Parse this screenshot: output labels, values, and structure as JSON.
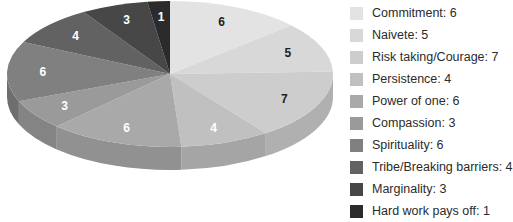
{
  "chart_data": {
    "type": "pie",
    "style": "3d",
    "title": "",
    "start_angle": "12 o'clock",
    "direction": "clockwise",
    "legend_position": "right",
    "categories": [
      "Commitment",
      "Naivete",
      "Risk taking/Courage",
      "Persistence",
      "Power of one",
      "Compassion",
      "Spirituality",
      "Tribe/Breaking barriers",
      "Marginality",
      "Hard work pays off"
    ],
    "values": [
      6,
      5,
      7,
      4,
      6,
      3,
      6,
      4,
      3,
      1
    ],
    "colors": [
      "#e3e3e3",
      "#d8d8d8",
      "#cdcdcd",
      "#c0c0c0",
      "#a9a9a9",
      "#9a9a9a",
      "#808080",
      "#626262",
      "#474747",
      "#2b2b2b"
    ],
    "label_colors": [
      "#1e1e1e",
      "#1e1e1e",
      "#1e1e1e",
      "#ffffff",
      "#ffffff",
      "#ffffff",
      "#ffffff",
      "#ffffff",
      "#ffffff",
      "#ffffff"
    ],
    "total": 45
  },
  "legend": {
    "items": [
      {
        "label": "Commitment: 6"
      },
      {
        "label": "Naivete: 5"
      },
      {
        "label": "Risk taking/Courage: 7"
      },
      {
        "label": "Persistence: 4"
      },
      {
        "label": "Power of one: 6"
      },
      {
        "label": "Compassion: 3"
      },
      {
        "label": "Spirituality: 6"
      },
      {
        "label": "Tribe/Breaking barriers: 4"
      },
      {
        "label": "Marginality: 3"
      },
      {
        "label": "Hard work pays off: 1"
      }
    ]
  }
}
